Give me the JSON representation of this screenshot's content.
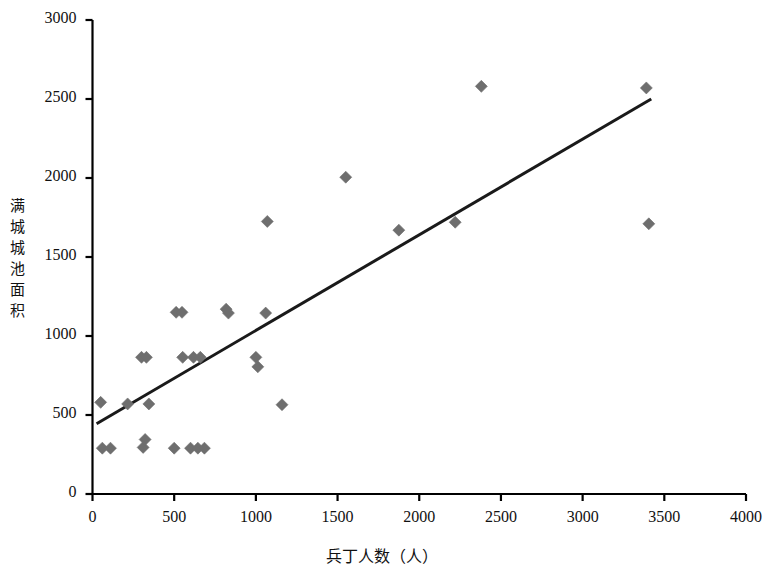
{
  "chart_data": {
    "type": "scatter",
    "title": "",
    "xlabel": "兵丁人数（人）",
    "ylabel": "满城城池面积",
    "xlim": [
      0,
      4000
    ],
    "ylim": [
      0,
      3000
    ],
    "xticks": [
      0,
      500,
      1000,
      1500,
      2000,
      2500,
      3000,
      3500,
      4000
    ],
    "yticks": [
      0,
      500,
      1000,
      1500,
      2000,
      2500,
      3000
    ],
    "xtick_labels": [
      "0",
      "500",
      "1000",
      "1500",
      "2000",
      "2500",
      "3000",
      "3500",
      "4000"
    ],
    "ytick_labels": [
      "0",
      "500",
      "1000",
      "1500",
      "2000",
      "2500",
      "3000"
    ],
    "grid": false,
    "legend": null,
    "marker": "diamond",
    "marker_color": "#6e6e6e",
    "marker_size": 11,
    "line_color": "#1a1a1a",
    "axis_color": "#000000",
    "background": "#ffffff",
    "points": [
      {
        "x": 50,
        "y": 580
      },
      {
        "x": 60,
        "y": 290
      },
      {
        "x": 110,
        "y": 290
      },
      {
        "x": 215,
        "y": 570
      },
      {
        "x": 300,
        "y": 865
      },
      {
        "x": 310,
        "y": 295
      },
      {
        "x": 322,
        "y": 345
      },
      {
        "x": 330,
        "y": 865
      },
      {
        "x": 345,
        "y": 570
      },
      {
        "x": 500,
        "y": 290
      },
      {
        "x": 512,
        "y": 1150
      },
      {
        "x": 548,
        "y": 1150
      },
      {
        "x": 552,
        "y": 865
      },
      {
        "x": 600,
        "y": 290
      },
      {
        "x": 618,
        "y": 865
      },
      {
        "x": 645,
        "y": 290
      },
      {
        "x": 660,
        "y": 865
      },
      {
        "x": 685,
        "y": 290
      },
      {
        "x": 818,
        "y": 1170
      },
      {
        "x": 832,
        "y": 1145
      },
      {
        "x": 1000,
        "y": 865
      },
      {
        "x": 1012,
        "y": 805
      },
      {
        "x": 1060,
        "y": 1145
      },
      {
        "x": 1070,
        "y": 1725
      },
      {
        "x": 1160,
        "y": 565
      },
      {
        "x": 1550,
        "y": 2005
      },
      {
        "x": 1875,
        "y": 1670
      },
      {
        "x": 2220,
        "y": 1720
      },
      {
        "x": 2380,
        "y": 2580
      },
      {
        "x": 3390,
        "y": 2570
      },
      {
        "x": 3405,
        "y": 1710
      }
    ],
    "trendline": {
      "x0": 25,
      "y0": 445,
      "x1": 3420,
      "y1": 2500
    }
  },
  "axis": {
    "y_title_chars": [
      "满",
      "城",
      "城",
      "池",
      "面",
      "积"
    ],
    "x_title": "兵丁人数（人）"
  }
}
